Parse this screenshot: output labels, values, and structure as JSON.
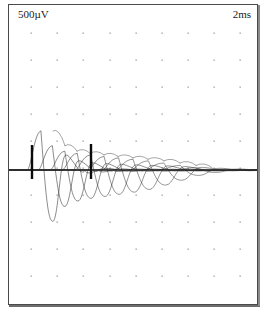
{
  "window": {
    "title": "EMG waveform display",
    "background_color": "#ffffff",
    "frame_color": "#4a4a4a"
  },
  "labels": {
    "amplitude_scale": "500µV",
    "time_scale": "2ms"
  },
  "chart_data": {
    "type": "line",
    "title": "",
    "subtitle": "",
    "xlabel": "",
    "ylabel": "",
    "grid": "dots",
    "legend_position": "none",
    "axis_note": "Oscilloscope-style sweep; one horizontal division = 2 ms, one vertical division = 500 µV",
    "x_division_ms": 2,
    "y_division_uv": 500,
    "x_divisions": 9,
    "y_divisions": 10,
    "xlim": [
      0,
      18
    ],
    "ylim": [
      -2500,
      2500
    ],
    "baseline_uv": 0,
    "trace_color": "#2b2b2b",
    "cursor_color": "#0b0b0b",
    "grid_color": "#9a9a9a",
    "cursors": [
      {
        "name": "cursor-1",
        "x_px": 32,
        "x_ms": 1.8,
        "top_px": 145,
        "bottom_px": 179
      },
      {
        "name": "cursor-2",
        "x_px": 91,
        "x_ms": 6.3,
        "top_px": 144,
        "bottom_px": 179
      }
    ],
    "series": [
      {
        "name": "sweep-1",
        "onset_px": 33,
        "peak_px": 53,
        "peak_amplitude_uv": 1450,
        "trough_amplitude_uv": -1900,
        "width_px": 36
      },
      {
        "name": "sweep-2",
        "onset_px": 44,
        "peak_px": 65,
        "peak_amplitude_uv": 900,
        "trough_amplitude_uv": -1350,
        "width_px": 38
      },
      {
        "name": "sweep-3",
        "onset_px": 56,
        "peak_px": 77,
        "peak_amplitude_uv": 700,
        "trough_amplitude_uv": -1150,
        "width_px": 40
      },
      {
        "name": "sweep-4",
        "onset_px": 68,
        "peak_px": 90,
        "peak_amplitude_uv": 620,
        "trough_amplitude_uv": -1050,
        "width_px": 42
      },
      {
        "name": "sweep-5",
        "onset_px": 81,
        "peak_px": 104,
        "peak_amplitude_uv": 560,
        "trough_amplitude_uv": -980,
        "width_px": 44
      },
      {
        "name": "sweep-6",
        "onset_px": 94,
        "peak_px": 118,
        "peak_amplitude_uv": 500,
        "trough_amplitude_uv": -900,
        "width_px": 46
      },
      {
        "name": "sweep-7",
        "onset_px": 108,
        "peak_px": 133,
        "peak_amplitude_uv": 450,
        "trough_amplitude_uv": -820,
        "width_px": 48
      },
      {
        "name": "sweep-8",
        "onset_px": 122,
        "peak_px": 148,
        "peak_amplitude_uv": 400,
        "trough_amplitude_uv": -720,
        "width_px": 50
      },
      {
        "name": "sweep-9",
        "onset_px": 137,
        "peak_px": 164,
        "peak_amplitude_uv": 340,
        "trough_amplitude_uv": -560,
        "width_px": 52
      },
      {
        "name": "sweep-10",
        "onset_px": 152,
        "peak_px": 180,
        "peak_amplitude_uv": 260,
        "trough_amplitude_uv": -380,
        "width_px": 54
      },
      {
        "name": "sweep-11",
        "onset_px": 168,
        "peak_px": 196,
        "peak_amplitude_uv": 170,
        "trough_amplitude_uv": -200,
        "width_px": 56
      },
      {
        "name": "sweep-12",
        "onset_px": 184,
        "peak_px": 212,
        "peak_amplitude_uv": 90,
        "trough_amplitude_uv": -90,
        "width_px": 58
      }
    ],
    "grid_x_px": [
      31,
      57,
      83,
      110,
      136,
      162,
      188,
      214,
      240
    ],
    "grid_y_px": [
      33,
      60,
      87,
      114,
      141,
      168,
      195,
      222,
      249,
      276
    ]
  },
  "icons": {
    "cursor_marker": "vertical-cursor-icon"
  }
}
